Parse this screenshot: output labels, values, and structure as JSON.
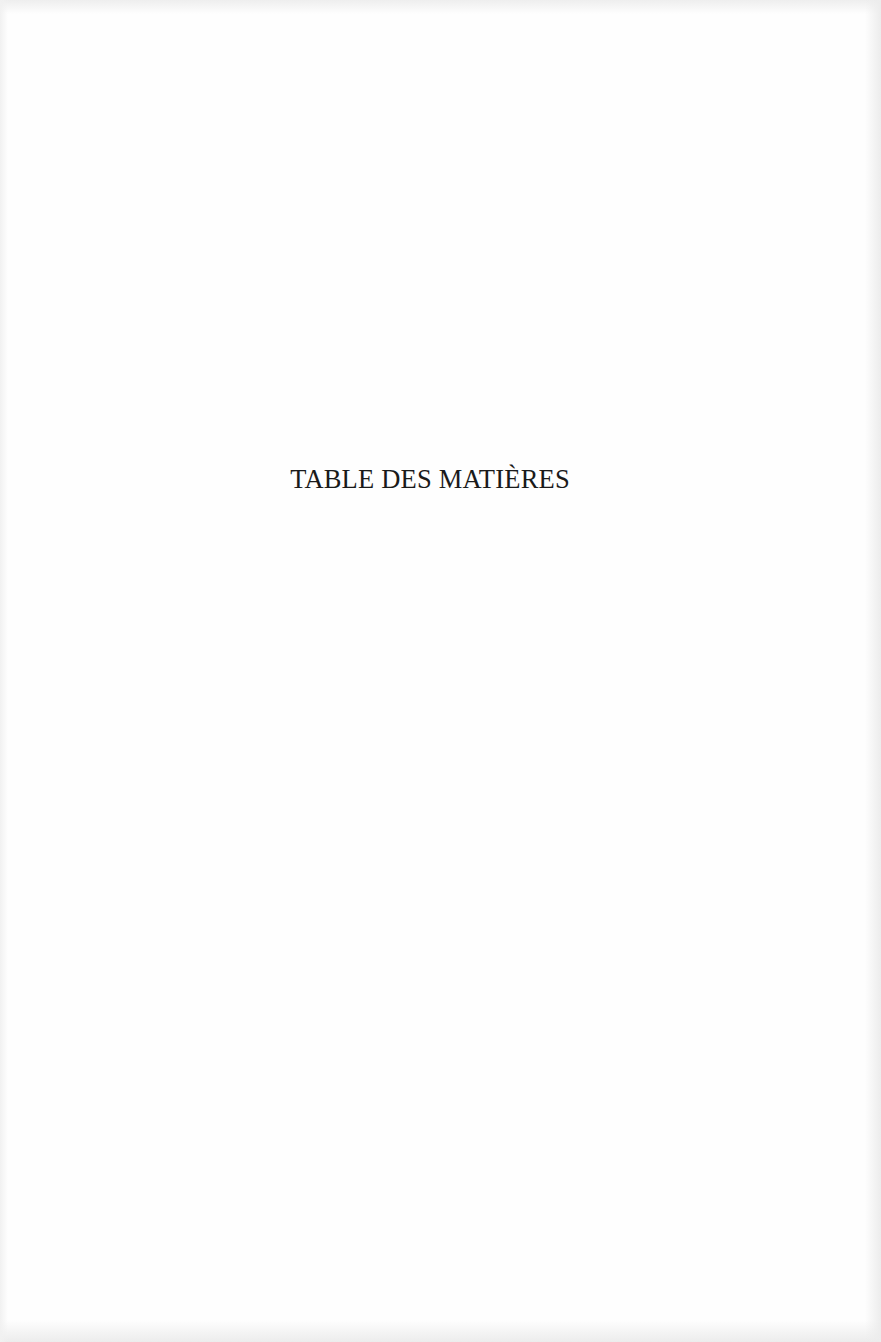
{
  "document": {
    "page_title": "TABLE DES MATIÈRES"
  },
  "colors": {
    "paper": "#fefefe",
    "ink": "#1a1a1a"
  }
}
